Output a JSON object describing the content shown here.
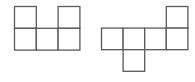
{
  "diagram": {
    "title": "",
    "line_color": "#5a5a5a",
    "figures": [
      {
        "name": "net-left",
        "cells": [
          {
            "row": 0,
            "col": 0
          },
          {
            "row": 0,
            "col": 2
          },
          {
            "row": 1,
            "col": 0
          },
          {
            "row": 1,
            "col": 1
          },
          {
            "row": 1,
            "col": 2
          }
        ]
      },
      {
        "name": "net-right",
        "cells": [
          {
            "row": 0,
            "col": 3
          },
          {
            "row": 1,
            "col": 0
          },
          {
            "row": 1,
            "col": 1
          },
          {
            "row": 1,
            "col": 2
          },
          {
            "row": 1,
            "col": 3
          },
          {
            "row": 2,
            "col": 1
          }
        ]
      }
    ]
  }
}
